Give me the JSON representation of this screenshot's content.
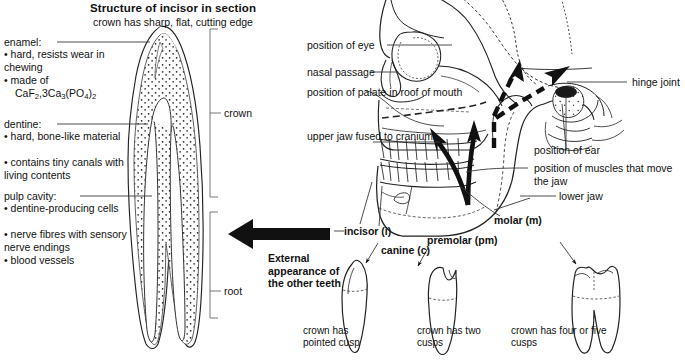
{
  "figure": {
    "title": "Structure of incisor in section",
    "subtitle": "crown has sharp, flat, cutting edge"
  },
  "incisor_section": {
    "labels": [
      {
        "id": "enamel",
        "heading": "enamel:",
        "bullets": [
          "hard, resists\nwear in chewing",
          "made of\nCaF2,3Ca3(PO4)2"
        ]
      },
      {
        "id": "dentine",
        "heading": "dentine:",
        "bullets": [
          "hard, bone-like\nmaterial",
          "contains tiny canals\nwith living contents"
        ]
      },
      {
        "id": "pulp-cavity",
        "heading": "pulp cavity:",
        "bullets": [
          "dentine-producing\ncells",
          "nerve fibres with\nsensory nerve endings",
          "blood vessels"
        ]
      }
    ],
    "enamel_formula": {
      "part1": "CaF",
      "sub1": "2",
      "part2": ",3Ca",
      "sub2": "3",
      "part3": "(PO",
      "sub3": "4",
      "part4": ")",
      "sub4": "2"
    },
    "brackets": [
      {
        "id": "crown",
        "label": "crown"
      },
      {
        "id": "root",
        "label": "root"
      }
    ]
  },
  "skull": {
    "left_labels": [
      {
        "id": "position-of-eye",
        "text": "position of eye"
      },
      {
        "id": "nasal-passage",
        "text": "nasal passage"
      },
      {
        "id": "position-of-palate",
        "text": "position of\npalate in roof\nof mouth"
      },
      {
        "id": "upper-jaw",
        "text": "upper jaw\nfused to cranium"
      }
    ],
    "right_labels": [
      {
        "id": "hinge-joint",
        "text": "hinge joint"
      },
      {
        "id": "position-of-ear",
        "text": "position of ear"
      },
      {
        "id": "position-of-muscles",
        "text": "position of muscles\nthat move the jaw"
      },
      {
        "id": "lower-jaw",
        "text": "lower jaw"
      }
    ]
  },
  "teeth_callouts": [
    {
      "id": "incisor",
      "text": "incisor (i)"
    },
    {
      "id": "canine",
      "text": "canine (c)"
    },
    {
      "id": "premolar",
      "text": "premolar (pm)"
    },
    {
      "id": "molar",
      "text": "molar (m)"
    }
  ],
  "external_appearance": {
    "heading": "External\nappearance of\nthe other teeth",
    "captions": [
      {
        "id": "canine-caption",
        "text": "crown has\npointed cusp"
      },
      {
        "id": "premolar-caption",
        "text": "crown has\ntwo cusps"
      },
      {
        "id": "molar-caption",
        "text": "crown has four\nor five cusps"
      }
    ]
  },
  "colors": {
    "ink": "#1a1a1a",
    "line": "#3a3a3a",
    "bracket": "#6a6a6a",
    "background": "#ffffff"
  }
}
